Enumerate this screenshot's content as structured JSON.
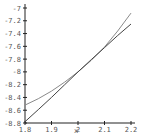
{
  "chart_data": {
    "type": "line",
    "title": "",
    "xlabel": "x",
    "ylabel": "",
    "xlim": [
      1.8,
      2.2
    ],
    "ylim": [
      -8.8,
      -7.0
    ],
    "grid": false,
    "legend": null,
    "x_ticks": [
      "1.8",
      "1.9",
      "2",
      "2.1",
      "2.2"
    ],
    "y_ticks": [
      "-7",
      "-7.2",
      "-7.4",
      "-7.6",
      "-7.8",
      "-8",
      "-8.2",
      "-8.4",
      "-8.6",
      "-8.8"
    ],
    "x": [
      1.8,
      1.85,
      1.9,
      1.95,
      2.0,
      2.05,
      2.1,
      2.15,
      2.2
    ],
    "series": [
      {
        "name": "curve",
        "color": "#8a8a8a",
        "values": [
          -8.52,
          -8.42,
          -8.3,
          -8.16,
          -8.0,
          -7.82,
          -7.61,
          -7.36,
          -7.08
        ]
      },
      {
        "name": "tangent line",
        "color": "#444444",
        "values": [
          -8.78,
          -8.59,
          -8.4,
          -8.2,
          -8.0,
          -7.81,
          -7.62,
          -7.43,
          -7.25
        ]
      }
    ]
  }
}
